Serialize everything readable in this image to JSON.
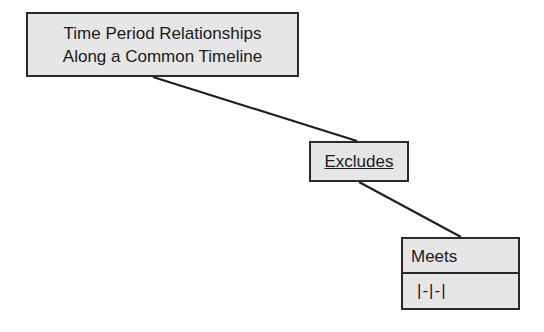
{
  "diagram": {
    "root": {
      "label_line1": "Time Period Relationships",
      "label_line2": "Along a Common Timeline"
    },
    "relation": {
      "label": "Excludes"
    },
    "leaf": {
      "name": "Meets",
      "symbol": "|-|-|"
    },
    "edges": [
      {
        "from": "root",
        "to": "relation"
      },
      {
        "from": "relation",
        "to": "leaf"
      }
    ],
    "colors": {
      "box_fill": "#e6e6e6",
      "border": "#2a2a2a",
      "background": "#ffffff"
    }
  }
}
